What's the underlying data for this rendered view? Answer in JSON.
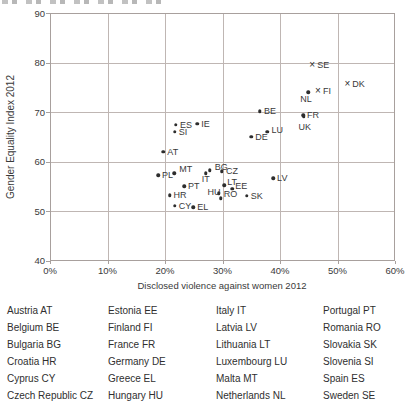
{
  "colors": {
    "background": "#ffffff",
    "text": "#3a3a3a",
    "grid": "#bfb6b3",
    "border": "#a8a09d",
    "marker": "#2d2d2d",
    "legend_text": "#2f2f2f"
  },
  "chart_data": {
    "type": "scatter",
    "xlabel": "Disclosed violence against women 2012",
    "ylabel": "Gender Equality Index 2012",
    "xlim": [
      0,
      60
    ],
    "ylim": [
      40,
      90
    ],
    "grid": true,
    "x_ticks": [
      "0%",
      "10%",
      "20%",
      "30%",
      "40%",
      "50%",
      "60%"
    ],
    "x_tick_values": [
      0,
      10,
      20,
      30,
      40,
      50,
      60
    ],
    "y_ticks": [
      "90",
      "80",
      "70",
      "60",
      "50",
      "40"
    ],
    "y_tick_values": [
      90,
      80,
      70,
      60,
      50,
      40
    ],
    "marker_glyphs": {
      "dot": "•",
      "cross": "×"
    },
    "points": [
      {
        "code": "SE",
        "x": 45.6,
        "y": 79.6,
        "m": "cross",
        "dx": 5,
        "dy": -4
      },
      {
        "code": "DK",
        "x": 51.7,
        "y": 75.6,
        "m": "cross",
        "dx": 5,
        "dy": -4
      },
      {
        "code": "FI",
        "x": 46.6,
        "y": 74.2,
        "m": "cross",
        "dx": 5,
        "dy": -4
      },
      {
        "code": "NL",
        "x": 44.9,
        "y": 74.0,
        "m": "dot",
        "dx": -8,
        "dy": 3
      },
      {
        "code": "FR",
        "x": 44.0,
        "y": 69.4,
        "m": "dot",
        "dx": 4,
        "dy": -4
      },
      {
        "code": "UK",
        "x": 44.1,
        "y": 69.1,
        "m": "dot",
        "dx": -5,
        "dy": 6
      },
      {
        "code": "BE",
        "x": 36.5,
        "y": 70.2,
        "m": "dot",
        "dx": 4,
        "dy": -4
      },
      {
        "code": "ES",
        "x": 21.9,
        "y": 67.4,
        "m": "dot",
        "dx": 4,
        "dy": -4
      },
      {
        "code": "IE",
        "x": 25.6,
        "y": 67.6,
        "m": "dot",
        "dx": 4,
        "dy": -4
      },
      {
        "code": "SI",
        "x": 21.7,
        "y": 66.0,
        "m": "dot",
        "dx": 4,
        "dy": -4
      },
      {
        "code": "LU",
        "x": 37.8,
        "y": 66.0,
        "m": "dot",
        "dx": 4,
        "dy": -6
      },
      {
        "code": "DE",
        "x": 35.0,
        "y": 65.0,
        "m": "dot",
        "dx": 4,
        "dy": -4
      },
      {
        "code": "AT",
        "x": 19.7,
        "y": 62.0,
        "m": "dot",
        "dx": 4,
        "dy": -4
      },
      {
        "code": "BG",
        "x": 27.8,
        "y": 58.2,
        "m": "dot",
        "dx": 5,
        "dy": -7
      },
      {
        "code": "CZ",
        "x": 29.9,
        "y": 58.0,
        "m": "dot",
        "dx": 4,
        "dy": -4
      },
      {
        "code": "MT",
        "x": 21.6,
        "y": 57.6,
        "m": "dot",
        "dx": 5,
        "dy": -8
      },
      {
        "code": "IT",
        "x": 27.1,
        "y": 57.6,
        "m": "dot",
        "dx": -4,
        "dy": 2
      },
      {
        "code": "PL",
        "x": 18.8,
        "y": 57.2,
        "m": "dot",
        "dx": 4,
        "dy": -4
      },
      {
        "code": "LV",
        "x": 38.8,
        "y": 56.6,
        "m": "dot",
        "dx": 4,
        "dy": -4
      },
      {
        "code": "LT",
        "x": 30.3,
        "y": 55.2,
        "m": "dot",
        "dx": 3,
        "dy": -7
      },
      {
        "code": "PT",
        "x": 23.3,
        "y": 55.0,
        "m": "dot",
        "dx": 4,
        "dy": -4
      },
      {
        "code": "EE",
        "x": 31.7,
        "y": 54.5,
        "m": "dot",
        "dx": 3,
        "dy": -7
      },
      {
        "code": "HU",
        "x": 29.3,
        "y": 53.6,
        "m": "dot",
        "dx": -11,
        "dy": -5
      },
      {
        "code": "SK",
        "x": 34.2,
        "y": 53.1,
        "m": "dot",
        "dx": 4,
        "dy": -4
      },
      {
        "code": "HR",
        "x": 20.8,
        "y": 53.2,
        "m": "dot",
        "dx": 4,
        "dy": -4
      },
      {
        "code": "RO",
        "x": 29.7,
        "y": 52.6,
        "m": "dot",
        "dx": 3,
        "dy": -8
      },
      {
        "code": "CY",
        "x": 21.7,
        "y": 51.1,
        "m": "dot",
        "dx": 4,
        "dy": -4
      },
      {
        "code": "EL",
        "x": 24.9,
        "y": 50.8,
        "m": "dot",
        "dx": 4,
        "dy": -4
      }
    ]
  },
  "legend": {
    "columns": [
      [
        "Austria AT",
        "Belgium BE",
        "Bulgaria BG",
        "Croatia HR",
        "Cyprus CY",
        "Czech Republic CZ"
      ],
      [
        "Estonia EE",
        "Finland FI",
        "France FR",
        "Germany DE",
        "Greece EL",
        "Hungary HU"
      ],
      [
        "Italy IT",
        "Latvia LV",
        "Lithuania LT",
        "Luxembourg LU",
        "Malta MT",
        "Netherlands NL"
      ],
      [
        "Portugal PT",
        "Romania RO",
        "Slovakia SK",
        "Slovenia SI",
        "Spain ES",
        "Sweden SE"
      ]
    ]
  }
}
